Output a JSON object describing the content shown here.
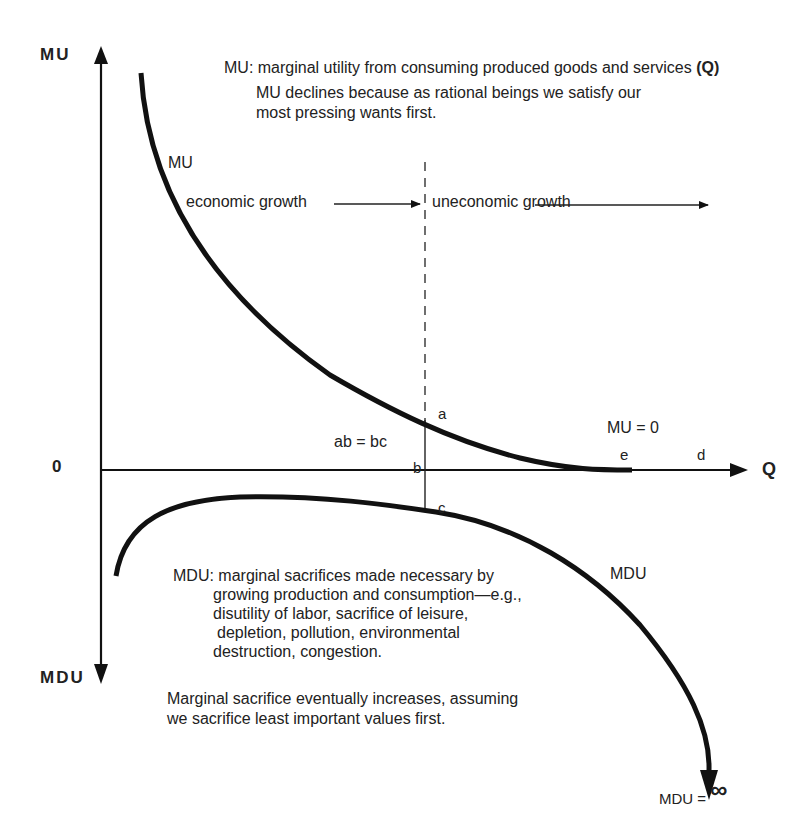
{
  "axes": {
    "y_positive_label": "MU",
    "y_negative_label": "MDU",
    "x_label": "Q",
    "origin_label": "0"
  },
  "annotations": {
    "mu_definition_prefix": "MU: marginal utility from consuming produced goods and services ",
    "mu_definition_q": "(Q)",
    "mu_explanation_line1": "MU declines because as rational beings we satisfy our",
    "mu_explanation_line2": "most pressing wants first.",
    "economic_growth": "economic growth",
    "uneconomic_growth": "uneconomic growth",
    "ab_equals_bc": "ab = bc",
    "mu_zero": "MU = 0",
    "mdu_definition_line1": "MDU: marginal sacrifices made necessary by",
    "mdu_definition_line2": "growing production and consumption—e.g.,",
    "mdu_definition_line3": "disutility of labor, sacrifice of leisure,",
    "mdu_definition_line4": "depletion, pollution, environmental",
    "mdu_definition_line5": "destruction, congestion.",
    "sacrifice_line1": "Marginal sacrifice eventually increases, assuming",
    "sacrifice_line2": "we sacrifice least important values first.",
    "mdu_infinity_prefix": "MDU = ",
    "mdu_infinity_symbol": "∞"
  },
  "curves": {
    "mu_curve_label": "MU",
    "mdu_curve_label": "MDU"
  },
  "points": {
    "a": "a",
    "b": "b",
    "c": "c",
    "d": "d",
    "e": "e"
  },
  "colors": {
    "ink": "#111111",
    "background": "#ffffff"
  }
}
